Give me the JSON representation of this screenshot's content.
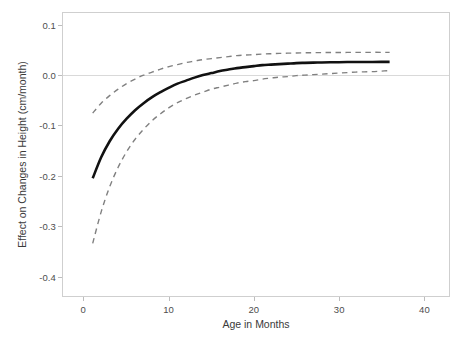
{
  "figure": {
    "width": 467,
    "height": 346,
    "background": "#ffffff",
    "frame_color": "#cfcfcf",
    "axis_text_color": "#4d4d4d",
    "title": ""
  },
  "chart_data": {
    "type": "line",
    "title": "",
    "subtitle": "",
    "xlabel": "Age in Months",
    "ylabel": "Effect on Changes in Height (cm/month)",
    "xlim": [
      -2.5,
      43
    ],
    "ylim": [
      -0.44,
      0.125
    ],
    "xticks": [
      0,
      10,
      20,
      30,
      40
    ],
    "xtick_labels": [
      "0",
      "10",
      "20",
      "30",
      "40"
    ],
    "yticks": [
      0.1,
      0.0,
      -0.1,
      -0.2,
      -0.3,
      -0.4
    ],
    "ytick_labels": [
      "0.1",
      "0.0",
      "-0.1",
      "-0.2",
      "-0.3",
      "-0.4"
    ],
    "grid": false,
    "legend": null,
    "reference_lines": [
      {
        "name": "zero-line",
        "orientation": "horizontal",
        "y": 0.0,
        "color": "#d9d9d9",
        "style": "solid"
      }
    ],
    "series": [
      {
        "name": "Estimated effect",
        "style": "solid",
        "color": "#111111",
        "width": 2.6,
        "x": [
          1,
          2,
          3,
          4,
          5,
          6,
          7,
          8,
          9,
          10,
          11,
          12,
          13,
          14,
          15,
          16,
          17,
          18,
          19,
          20,
          21,
          22,
          23,
          24,
          25,
          26,
          27,
          28,
          29,
          30,
          31,
          32,
          33,
          34,
          35,
          36
        ],
        "values": [
          -0.205,
          -0.163,
          -0.131,
          -0.106,
          -0.086,
          -0.069,
          -0.055,
          -0.043,
          -0.033,
          -0.024,
          -0.016,
          -0.01,
          -0.004,
          0.001,
          0.005,
          0.009,
          0.012,
          0.015,
          0.017,
          0.019,
          0.021,
          0.022,
          0.023,
          0.024,
          0.025,
          0.0255,
          0.026,
          0.0263,
          0.0266,
          0.0268,
          0.027,
          0.0271,
          0.0272,
          0.0273,
          0.0274,
          0.0275
        ]
      },
      {
        "name": "Upper 95% confidence band",
        "style": "dashed",
        "color": "#808080",
        "width": 1.4,
        "x": [
          1,
          2,
          3,
          4,
          5,
          6,
          7,
          8,
          9,
          10,
          11,
          12,
          13,
          14,
          15,
          16,
          17,
          18,
          19,
          20,
          21,
          22,
          23,
          24,
          25,
          26,
          27,
          28,
          29,
          30,
          31,
          32,
          33,
          34,
          35,
          36
        ],
        "values": [
          -0.075,
          -0.055,
          -0.04,
          -0.027,
          -0.016,
          -0.007,
          0.001,
          0.007,
          0.013,
          0.018,
          0.022,
          0.026,
          0.029,
          0.032,
          0.034,
          0.036,
          0.038,
          0.04,
          0.041,
          0.042,
          0.043,
          0.0437,
          0.0443,
          0.0448,
          0.0452,
          0.0455,
          0.0458,
          0.046,
          0.0461,
          0.0462,
          0.0463,
          0.0464,
          0.0464,
          0.0465,
          0.0465,
          0.0465
        ]
      },
      {
        "name": "Lower 95% confidence band",
        "style": "dashed",
        "color": "#808080",
        "width": 1.4,
        "x": [
          1,
          2,
          3,
          4,
          5,
          6,
          7,
          8,
          9,
          10,
          11,
          12,
          13,
          14,
          15,
          16,
          17,
          18,
          19,
          20,
          21,
          22,
          23,
          24,
          25,
          26,
          27,
          28,
          29,
          30,
          31,
          32,
          33,
          34,
          35,
          36
        ],
        "values": [
          -0.335,
          -0.272,
          -0.222,
          -0.183,
          -0.152,
          -0.127,
          -0.107,
          -0.09,
          -0.076,
          -0.064,
          -0.054,
          -0.046,
          -0.039,
          -0.033,
          -0.027,
          -0.023,
          -0.019,
          -0.015,
          -0.012,
          -0.01,
          -0.007,
          -0.005,
          -0.003,
          -0.002,
          0.0,
          0.001,
          0.002,
          0.003,
          0.004,
          0.005,
          0.006,
          0.007,
          0.0075,
          0.008,
          0.009,
          0.01
        ]
      }
    ],
    "annotations": []
  }
}
